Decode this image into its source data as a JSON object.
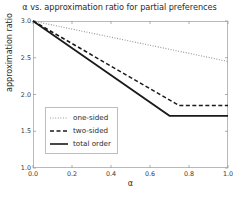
{
  "chart_data": {
    "type": "line",
    "title": "α vs. approximation ratio for partial preferences",
    "xlabel": "α",
    "ylabel": "approximation ratio",
    "xlim": [
      0.0,
      1.0
    ],
    "ylim": [
      1.0,
      3.0
    ],
    "xticks": [
      "0.0",
      "0.2",
      "0.4",
      "0.6",
      "0.8",
      "1.0"
    ],
    "xtick_values": [
      0.0,
      0.2,
      0.4,
      0.6,
      0.8,
      1.0
    ],
    "yticks": [
      "1.0",
      "1.5",
      "2.0",
      "2.5",
      "3.0"
    ],
    "ytick_values": [
      1.0,
      1.5,
      2.0,
      2.5,
      3.0
    ],
    "grid": false,
    "legend_position": "lower left",
    "series": [
      {
        "name": "one-sided",
        "style": "dotted",
        "color": "#9a9a9a",
        "x": [
          0.0,
          1.0
        ],
        "values": [
          3.0,
          2.45
        ]
      },
      {
        "name": "two-sided",
        "style": "dashed",
        "color": "#1a1a1a",
        "x": [
          0.0,
          0.75,
          1.0
        ],
        "values": [
          3.0,
          1.85,
          1.85
        ]
      },
      {
        "name": "total order",
        "style": "solid",
        "color": "#1a1a1a",
        "x": [
          0.0,
          0.7,
          1.0
        ],
        "values": [
          3.0,
          1.71,
          1.71
        ]
      }
    ]
  },
  "legend": {
    "items": [
      {
        "label": "one-sided"
      },
      {
        "label": "two-sided"
      },
      {
        "label": "total order"
      }
    ]
  }
}
